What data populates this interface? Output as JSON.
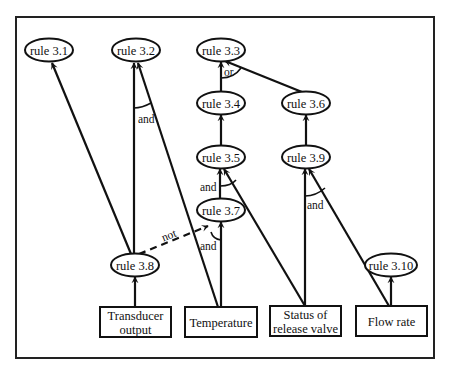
{
  "diagram": {
    "type": "inference-network",
    "colors": {
      "stroke": "#111111",
      "background": "#ffffff"
    },
    "rules": [
      {
        "id": "r31",
        "label": "rule 3.1",
        "cx": 49,
        "cy": 50
      },
      {
        "id": "r32",
        "label": "rule 3.2",
        "cx": 136,
        "cy": 50
      },
      {
        "id": "r33",
        "label": "rule 3.3",
        "cx": 221,
        "cy": 50
      },
      {
        "id": "r34",
        "label": "rule 3.4",
        "cx": 221,
        "cy": 103
      },
      {
        "id": "r36",
        "label": "rule 3.6",
        "cx": 306,
        "cy": 103
      },
      {
        "id": "r35",
        "label": "rule 3.5",
        "cx": 221,
        "cy": 157
      },
      {
        "id": "r39",
        "label": "rule 3.9",
        "cx": 306,
        "cy": 157
      },
      {
        "id": "r37",
        "label": "rule 3.7",
        "cx": 221,
        "cy": 210
      },
      {
        "id": "r38",
        "label": "rule 3.8",
        "cx": 135,
        "cy": 265
      },
      {
        "id": "r310",
        "label": "rule 3.10",
        "cx": 390,
        "cy": 265
      }
    ],
    "inputs": [
      {
        "id": "transducer",
        "lines": [
          "Transducer",
          "output"
        ],
        "x": 100,
        "y": 307,
        "w": 71,
        "h": 30
      },
      {
        "id": "temperature",
        "lines": [
          "Temperature"
        ],
        "x": 185,
        "y": 307,
        "w": 72,
        "h": 30
      },
      {
        "id": "status",
        "lines": [
          "Status of",
          "release valve"
        ],
        "x": 270,
        "y": 306,
        "w": 71,
        "h": 30
      },
      {
        "id": "flow",
        "lines": [
          "Flow rate"
        ],
        "x": 356,
        "y": 306,
        "w": 71,
        "h": 30
      }
    ],
    "edge_labels": {
      "and_r32": "and",
      "or_r33": "or",
      "and_r35": "and",
      "and_r37": "and",
      "and_r39": "and",
      "not_r38_r37": "not"
    }
  }
}
